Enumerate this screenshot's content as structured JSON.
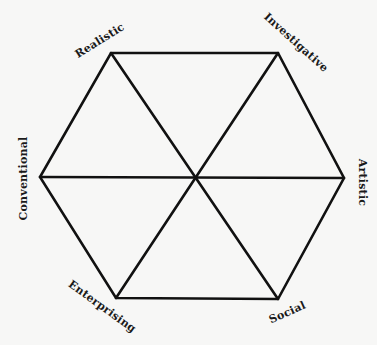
{
  "diagram": {
    "type": "hexagon",
    "title": "",
    "stroke_color": "#111111",
    "background": "#f7f7f6",
    "center": [
      196,
      177
    ],
    "vertices": [
      {
        "name": "Realistic",
        "x": 111,
        "y": 53
      },
      {
        "name": "Investigative",
        "x": 278,
        "y": 53
      },
      {
        "name": "Artistic",
        "x": 344,
        "y": 178
      },
      {
        "name": "Social",
        "x": 278,
        "y": 299
      },
      {
        "name": "Enterprising",
        "x": 116,
        "y": 298
      },
      {
        "name": "Conventional",
        "x": 40,
        "y": 177
      }
    ],
    "labels": {
      "realistic": "Realistic",
      "investigative": "Investigative",
      "artistic": "Artistic",
      "social": "Social",
      "enterprising": "Enterprising",
      "conventional": "Conventional"
    }
  }
}
